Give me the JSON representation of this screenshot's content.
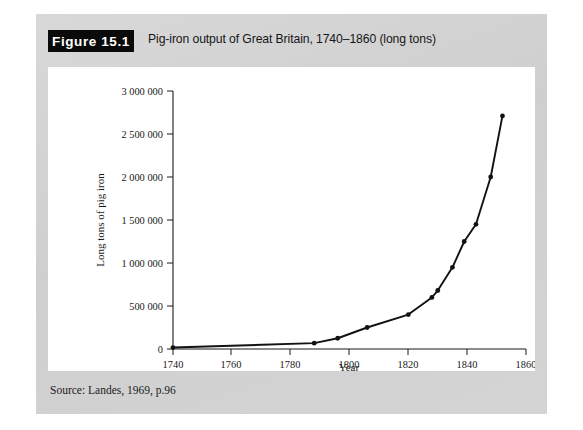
{
  "figure": {
    "number_label": "Figure 15.1",
    "caption": "Pig-iron output of Great Britain, 1740–1860 (long tons)",
    "source": "Source: Landes, 1969, p.96"
  },
  "colors": {
    "banner_background": "#0a0a0a",
    "banner_text": "#ffffff",
    "figure_background": "#d2d2d2",
    "panel_background": "#ffffff",
    "line": "#121212",
    "axis": "#1a1a1a"
  },
  "chart_data": {
    "type": "line",
    "title": "Pig-iron output of Great Britain, 1740–1860 (long tons)",
    "xlabel": "Year",
    "ylabel": "Long tons of pig iron",
    "xlim": [
      1740,
      1860
    ],
    "ylim": [
      0,
      3000000
    ],
    "grid": false,
    "legend": false,
    "xticks": [
      1740,
      1760,
      1780,
      1800,
      1820,
      1840,
      1860
    ],
    "xticklabels": [
      "1740",
      "1760",
      "1780",
      "1800",
      "1820",
      "1840",
      "1860"
    ],
    "yticks": [
      0,
      500000,
      1000000,
      1500000,
      2000000,
      2500000,
      3000000
    ],
    "yticklabels": [
      "0",
      "500 000",
      "1 000 000",
      "1 500 000",
      "2 000 000",
      "2 500 000",
      "3 000 000"
    ],
    "markers": "filled-circle",
    "x": [
      1740,
      1788,
      1796,
      1806,
      1820,
      1828,
      1830,
      1835,
      1839,
      1843,
      1848,
      1852
    ],
    "y": [
      17000,
      68000,
      125000,
      250000,
      400000,
      600000,
      680000,
      950000,
      1250000,
      1450000,
      2000000,
      2710000
    ],
    "series": [
      {
        "name": "Pig-iron output",
        "points": [
          {
            "year": 1740,
            "value": 17000
          },
          {
            "year": 1788,
            "value": 68000
          },
          {
            "year": 1796,
            "value": 125000
          },
          {
            "year": 1806,
            "value": 250000
          },
          {
            "year": 1820,
            "value": 400000
          },
          {
            "year": 1828,
            "value": 600000
          },
          {
            "year": 1830,
            "value": 680000
          },
          {
            "year": 1835,
            "value": 950000
          },
          {
            "year": 1839,
            "value": 1250000
          },
          {
            "year": 1843,
            "value": 1450000
          },
          {
            "year": 1848,
            "value": 2000000
          },
          {
            "year": 1852,
            "value": 2710000
          }
        ]
      }
    ]
  }
}
